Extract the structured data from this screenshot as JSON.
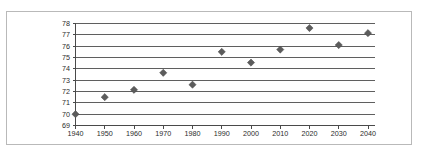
{
  "figure": {
    "border_color": "#b9b9b9",
    "background_color": "#ffffff"
  },
  "chart_data": {
    "type": "scatter",
    "title": "",
    "subtitle": "",
    "xlabel": "",
    "ylabel": "",
    "x": [
      1940,
      1950,
      1960,
      1970,
      1980,
      1990,
      2000,
      2010,
      2020,
      2030,
      2040
    ],
    "values": [
      70.0,
      71.5,
      72.15,
      73.65,
      72.6,
      75.5,
      74.55,
      75.7,
      77.6,
      76.1,
      77.15
    ],
    "series": [
      {
        "name": "",
        "marker": "diamond",
        "color": "#5c5c5c",
        "values": [
          70.0,
          71.5,
          72.15,
          73.65,
          72.6,
          75.5,
          74.55,
          75.7,
          77.6,
          76.1,
          77.15
        ]
      }
    ],
    "xlim": [
      1940,
      2040
    ],
    "ylim": [
      69,
      78
    ],
    "xticks": [
      1940,
      1950,
      1960,
      1970,
      1980,
      1990,
      2000,
      2010,
      2020,
      2030,
      2040
    ],
    "xtick_labels": [
      "1940",
      "1950",
      "1960",
      "1970",
      "1980",
      "1990",
      "2000",
      "2010",
      "2020",
      "2030",
      "2040"
    ],
    "yticks": [
      69,
      70,
      71,
      72,
      73,
      74,
      75,
      76,
      77,
      78
    ],
    "ytick_labels": [
      "69",
      "70",
      "71",
      "72",
      "73",
      "74",
      "75",
      "76",
      "77",
      "78"
    ],
    "grid": true,
    "grid_axis": "y",
    "grid_color": "#5f5f5f",
    "legend": false,
    "legend_position": "none",
    "annotations": []
  }
}
